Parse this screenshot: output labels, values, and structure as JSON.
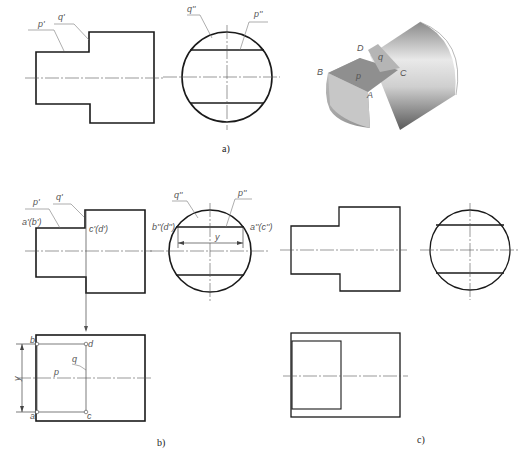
{
  "figure_a": {
    "caption": "a)",
    "front_view": {
      "labels": {
        "p": "p'",
        "q": "q'"
      }
    },
    "side_view": {
      "labels": {
        "q": "q''",
        "p": "p''"
      }
    },
    "iso_view": {
      "labels": {
        "D": "D",
        "q": "q",
        "B": "B",
        "p": "p",
        "C": "C",
        "A": "A"
      }
    }
  },
  "figure_b": {
    "caption": "b)",
    "front_view": {
      "labels": {
        "p": "p'",
        "q": "q'",
        "ab": "a'(b')",
        "cd": "c'(d')"
      }
    },
    "side_view": {
      "labels": {
        "q": "q''",
        "p": "p''",
        "bd": "b''(d'')",
        "ac": "a''(c'')",
        "y": "y"
      }
    },
    "top_view": {
      "labels": {
        "b": "b",
        "d": "d",
        "q": "q",
        "p": "p",
        "a": "a",
        "c": "c",
        "y": "y"
      }
    }
  },
  "figure_c": {
    "caption": "c)"
  }
}
